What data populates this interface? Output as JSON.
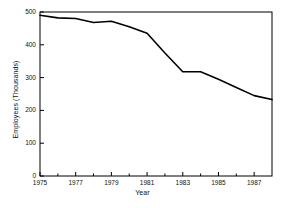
{
  "chart_data": {
    "type": "line",
    "title": "",
    "xlabel": "Year",
    "ylabel": "Employees (Thousands)",
    "x": [
      1975,
      1976,
      1977,
      1978,
      1979,
      1980,
      1981,
      1982,
      1983,
      1984,
      1985,
      1986,
      1987,
      1988
    ],
    "values": [
      490,
      482,
      480,
      468,
      472,
      455,
      435,
      375,
      318,
      318,
      295,
      270,
      245,
      233
    ],
    "series": [
      {
        "name": "Employees",
        "values": [
          490,
          482,
          480,
          468,
          472,
          455,
          435,
          375,
          318,
          318,
          295,
          270,
          245,
          233
        ]
      }
    ],
    "xlim": [
      1975,
      1988
    ],
    "ylim": [
      0,
      500
    ],
    "x_ticks": [
      1975,
      1977,
      1979,
      1981,
      1983,
      1985,
      1987
    ],
    "x_tick_labels": [
      "1975",
      "1977",
      "1979",
      "1981",
      "1983",
      "1985",
      "1987"
    ],
    "x_minor_ticks": [
      1976,
      1978,
      1980,
      1982,
      1984,
      1986,
      1988
    ],
    "y_ticks": [
      0,
      100,
      200,
      300,
      400,
      500
    ],
    "y_tick_labels": [
      "0",
      "100",
      "200",
      "300",
      "400",
      "500"
    ],
    "grid": false,
    "legend": "none",
    "line_color": "#000000",
    "frame_color": "#000000",
    "background": "#ffffff"
  }
}
